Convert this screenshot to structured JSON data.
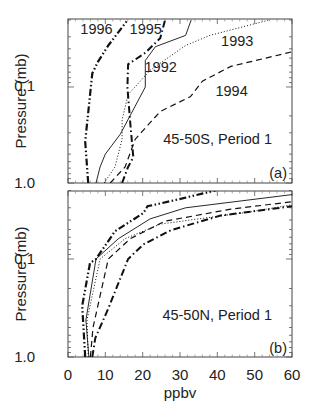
{
  "figure": {
    "x_ticks": [
      "0",
      "10",
      "20",
      "30",
      "40",
      "50",
      "60"
    ],
    "xlabel": "ppbv"
  },
  "chart_data": [
    {
      "type": "line",
      "panel": "(a)",
      "annotation": "45-50S, Period 1",
      "xlabel": "ppbv",
      "ylabel": "Pressure (mb)",
      "xlim": [
        0,
        60
      ],
      "ylim": [
        1.0,
        0.02
      ],
      "yscale": "log",
      "y_ticks": [
        "0.1",
        "1.0"
      ],
      "grid": false,
      "legend": "inline labels",
      "series": [
        {
          "name": "1992",
          "style": "solid",
          "label_pos": [
            20.5,
            0.062
          ],
          "points": [
            [
              7.5,
              1.0
            ],
            [
              8.6,
              0.68
            ],
            [
              10,
              0.5
            ],
            [
              14,
              0.31
            ],
            [
              20.7,
              0.1
            ],
            [
              20.7,
              0.053
            ],
            [
              23.4,
              0.038
            ],
            [
              31.5,
              0.029
            ],
            [
              33,
              0.02
            ]
          ]
        },
        {
          "name": "1993",
          "style": "dotted",
          "label_pos": [
            41,
            0.033
          ],
          "points": [
            [
              9.7,
              1.0
            ],
            [
              12.6,
              0.68
            ],
            [
              14.5,
              0.35
            ],
            [
              14.5,
              0.22
            ],
            [
              16.1,
              0.12
            ],
            [
              22,
              0.067
            ],
            [
              31.5,
              0.037
            ],
            [
              38,
              0.029
            ],
            [
              54,
              0.02
            ]
          ]
        },
        {
          "name": "1994",
          "style": "dashed",
          "label_pos": [
            39.5,
            0.11
          ],
          "points": [
            [
              11.3,
              1.0
            ],
            [
              15.3,
              0.68
            ],
            [
              18,
              0.35
            ],
            [
              24.7,
              0.18
            ],
            [
              32.8,
              0.126
            ],
            [
              36,
              0.087
            ],
            [
              43.6,
              0.061
            ],
            [
              60,
              0.043
            ]
          ]
        },
        {
          "name": "1995",
          "style": "dashdot",
          "label_pos": [
            16.5,
            0.025
          ],
          "points": [
            [
              14.5,
              1.0
            ],
            [
              16.1,
              0.68
            ],
            [
              17.5,
              0.54
            ],
            [
              16.7,
              0.24
            ],
            [
              15.9,
              0.1
            ],
            [
              16.1,
              0.058
            ],
            [
              20.7,
              0.044
            ],
            [
              24.7,
              0.031
            ],
            [
              26,
              0.02
            ]
          ]
        },
        {
          "name": "1996",
          "style": "dashdotdot",
          "label_pos": [
            3.3,
            0.025
          ],
          "points": [
            [
              5.4,
              1.0
            ],
            [
              4.6,
              0.37
            ],
            [
              6.5,
              0.072
            ],
            [
              8.1,
              0.054
            ],
            [
              10.8,
              0.037
            ],
            [
              16,
              0.02
            ]
          ]
        }
      ]
    },
    {
      "type": "line",
      "panel": "(b)",
      "annotation": "45-50N, Period 1",
      "xlabel": "ppbv",
      "ylabel": "Pressure (mb)",
      "xlim": [
        0,
        60
      ],
      "ylim": [
        1.0,
        0.02
      ],
      "yscale": "log",
      "y_ticks": [
        "0.1",
        "1.0"
      ],
      "grid": false,
      "series": [
        {
          "name": "1992",
          "style": "solid",
          "points": [
            [
              5.6,
              1.0
            ],
            [
              4.8,
              0.42
            ],
            [
              7.5,
              0.1
            ],
            [
              13.5,
              0.062
            ],
            [
              22,
              0.039
            ],
            [
              31.5,
              0.03
            ],
            [
              60,
              0.022
            ]
          ]
        },
        {
          "name": "1993",
          "style": "dotted",
          "points": [
            [
              5.4,
              1.0
            ],
            [
              5.1,
              0.42
            ],
            [
              8.6,
              0.1
            ],
            [
              15.3,
              0.062
            ],
            [
              24.7,
              0.044
            ],
            [
              49,
              0.033
            ],
            [
              60,
              0.028
            ]
          ]
        },
        {
          "name": "1994",
          "style": "dashed",
          "points": [
            [
              6.0,
              1.0
            ],
            [
              6.7,
              0.5
            ],
            [
              10.8,
              0.1
            ],
            [
              16.7,
              0.062
            ],
            [
              26,
              0.041
            ],
            [
              43.6,
              0.031
            ],
            [
              60,
              0.026
            ]
          ]
        },
        {
          "name": "1995",
          "style": "dashdot",
          "points": [
            [
              6.5,
              1.0
            ],
            [
              7.3,
              0.64
            ],
            [
              10.8,
              0.32
            ],
            [
              16.1,
              0.1
            ],
            [
              20.2,
              0.071
            ],
            [
              27.5,
              0.051
            ],
            [
              40.9,
              0.036
            ],
            [
              60,
              0.029
            ]
          ]
        },
        {
          "name": "1996",
          "style": "dashdotdot",
          "points": [
            [
              4.6,
              1.0
            ],
            [
              3.8,
              0.3
            ],
            [
              5.9,
              0.11
            ],
            [
              7.5,
              0.1
            ],
            [
              12.6,
              0.052
            ],
            [
              20.2,
              0.034
            ],
            [
              21.3,
              0.029
            ],
            [
              28.8,
              0.025
            ],
            [
              39.5,
              0.02
            ]
          ]
        }
      ]
    }
  ]
}
